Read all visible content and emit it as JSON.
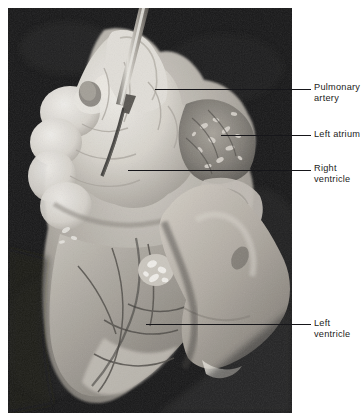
{
  "figure": {
    "background_color": "#ffffff",
    "photo": {
      "name": "heart-specimen-photograph",
      "left": 8,
      "top": 8,
      "width": 284,
      "height": 405,
      "background_color": "#0b0b0b",
      "tissue_light_color": "#e9e6df",
      "tissue_mid_color": "#b9b4ac",
      "tissue_dark_color": "#6e6a64",
      "probe_color": "#cfcbc4",
      "hand_color": "#cbc5bd"
    }
  },
  "annotations": [
    {
      "id": "pulmonary-artery",
      "text": "Pulmonary\nartery",
      "line": {
        "x1": 155,
        "y1": 89,
        "x2": 311,
        "y2": 89
      },
      "label": {
        "x": 314,
        "y": 82
      }
    },
    {
      "id": "left-atrium",
      "text": "Left atrium",
      "line": {
        "x1": 221,
        "y1": 135,
        "x2": 311,
        "y2": 135
      },
      "label": {
        "x": 314,
        "y": 129
      }
    },
    {
      "id": "right-ventricle",
      "text": "Right\nventricle",
      "line": {
        "x1": 128,
        "y1": 170,
        "x2": 311,
        "y2": 170
      },
      "label": {
        "x": 314,
        "y": 163
      }
    },
    {
      "id": "left-ventricle",
      "text": "Left\nventricle",
      "line": {
        "x1": 146,
        "y1": 324,
        "x2": 311,
        "y2": 324
      },
      "label": {
        "x": 314,
        "y": 318
      }
    }
  ]
}
